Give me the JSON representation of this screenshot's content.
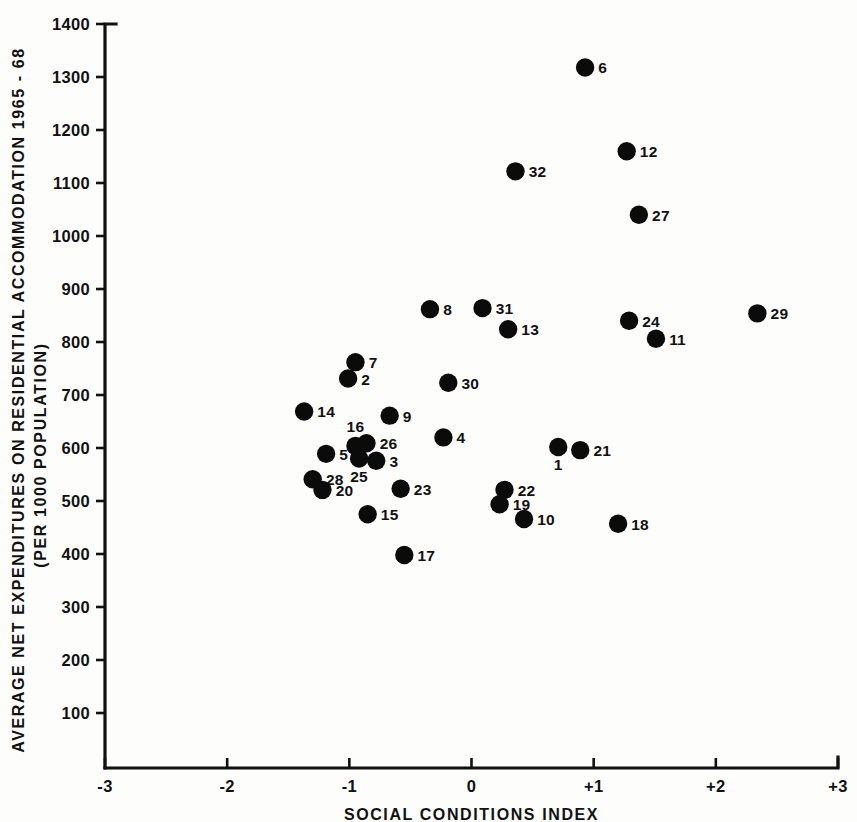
{
  "chart_data": {
    "type": "scatter",
    "title": "",
    "xlabel": "SOCIAL CONDITIONS INDEX",
    "ylabel": "AVERAGE NET EXPENDITURES ON RESIDENTIAL ACCOMMODATION 1965 - 68",
    "ylabel_line2": "(PER 1000 POPULATION)",
    "xlim": [
      -3,
      3
    ],
    "ylim": [
      0,
      1400
    ],
    "grid": false,
    "legend": "none",
    "xticks": [
      -3,
      -2,
      -1,
      0,
      1,
      2,
      3
    ],
    "xtick_labels": [
      "-3",
      "-2",
      "-1",
      "0",
      "+1",
      "+2",
      "+3"
    ],
    "yticks": [
      100,
      200,
      300,
      400,
      500,
      600,
      700,
      800,
      900,
      1000,
      1100,
      1200,
      1300,
      1400
    ],
    "ytick_labels": [
      "100",
      "200",
      "300",
      "400",
      "500",
      "600",
      "700",
      "800",
      "900",
      "1000",
      "1100",
      "1200",
      "1300",
      "1400"
    ],
    "marker_color": "#0b0b0b",
    "points": [
      {
        "label": "6",
        "x": 0.93,
        "y": 1318,
        "lpos": "right"
      },
      {
        "label": "12",
        "x": 1.27,
        "y": 1160,
        "lpos": "right"
      },
      {
        "label": "32",
        "x": 0.36,
        "y": 1122,
        "lpos": "right"
      },
      {
        "label": "27",
        "x": 1.37,
        "y": 1040,
        "lpos": "right"
      },
      {
        "label": "8",
        "x": -0.34,
        "y": 862,
        "lpos": "right"
      },
      {
        "label": "31",
        "x": 0.09,
        "y": 864,
        "lpos": "right"
      },
      {
        "label": "29",
        "x": 2.34,
        "y": 854,
        "lpos": "right"
      },
      {
        "label": "24",
        "x": 1.29,
        "y": 840,
        "lpos": "right"
      },
      {
        "label": "13",
        "x": 0.3,
        "y": 824,
        "lpos": "right"
      },
      {
        "label": "11",
        "x": 1.51,
        "y": 806,
        "lpos": "right"
      },
      {
        "label": "7",
        "x": -0.95,
        "y": 762,
        "lpos": "right"
      },
      {
        "label": "2",
        "x": -1.01,
        "y": 731,
        "lpos": "right"
      },
      {
        "label": "30",
        "x": -0.19,
        "y": 723,
        "lpos": "right"
      },
      {
        "label": "14",
        "x": -1.37,
        "y": 669,
        "lpos": "right"
      },
      {
        "label": "9",
        "x": -0.67,
        "y": 661,
        "lpos": "right"
      },
      {
        "label": "4",
        "x": -0.23,
        "y": 620,
        "lpos": "right"
      },
      {
        "label": "1",
        "x": 0.71,
        "y": 602,
        "lpos": "below"
      },
      {
        "label": "16",
        "x": -0.95,
        "y": 604,
        "lpos": "above"
      },
      {
        "label": "21",
        "x": 0.89,
        "y": 596,
        "lpos": "right"
      },
      {
        "label": "26",
        "x": -0.86,
        "y": 609,
        "lpos": "right"
      },
      {
        "label": "25",
        "x": -0.92,
        "y": 580,
        "lpos": "below"
      },
      {
        "label": "3",
        "x": -0.78,
        "y": 576,
        "lpos": "right"
      },
      {
        "label": "5",
        "x": -1.19,
        "y": 589,
        "lpos": "right"
      },
      {
        "label": "28",
        "x": -1.3,
        "y": 541,
        "lpos": "right"
      },
      {
        "label": "20",
        "x": -1.22,
        "y": 521,
        "lpos": "right"
      },
      {
        "label": "23",
        "x": -0.58,
        "y": 523,
        "lpos": "right"
      },
      {
        "label": "22",
        "x": 0.27,
        "y": 521,
        "lpos": "right"
      },
      {
        "label": "19",
        "x": 0.23,
        "y": 494,
        "lpos": "right"
      },
      {
        "label": "15",
        "x": -0.85,
        "y": 475,
        "lpos": "right"
      },
      {
        "label": "10",
        "x": 0.43,
        "y": 466,
        "lpos": "right"
      },
      {
        "label": "18",
        "x": 1.2,
        "y": 457,
        "lpos": "right"
      },
      {
        "label": "17",
        "x": -0.55,
        "y": 398,
        "lpos": "right"
      }
    ]
  }
}
